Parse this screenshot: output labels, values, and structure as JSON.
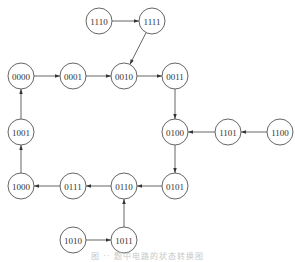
{
  "diagram": {
    "type": "state-transition-diagram",
    "node_radius": 13,
    "nodes": [
      {
        "id": "1110",
        "label": "1110",
        "x": 99,
        "y": 21
      },
      {
        "id": "1111",
        "label": "1111",
        "x": 152,
        "y": 21
      },
      {
        "id": "0000",
        "label": "0000",
        "x": 21,
        "y": 76
      },
      {
        "id": "0001",
        "label": "0001",
        "x": 73,
        "y": 76
      },
      {
        "id": "0010",
        "label": "0010",
        "x": 124,
        "y": 76
      },
      {
        "id": "0011",
        "label": "0011",
        "x": 175,
        "y": 76
      },
      {
        "id": "1001",
        "label": "1001",
        "x": 21,
        "y": 132
      },
      {
        "id": "0100",
        "label": "0100",
        "x": 175,
        "y": 132
      },
      {
        "id": "1101",
        "label": "1101",
        "x": 228,
        "y": 132
      },
      {
        "id": "1100",
        "label": "1100",
        "x": 280,
        "y": 132
      },
      {
        "id": "1000",
        "label": "1000",
        "x": 21,
        "y": 186
      },
      {
        "id": "0111",
        "label": "0111",
        "x": 73,
        "y": 186
      },
      {
        "id": "0110",
        "label": "0110",
        "x": 124,
        "y": 186
      },
      {
        "id": "0101",
        "label": "0101",
        "x": 175,
        "y": 186
      },
      {
        "id": "1010",
        "label": "1010",
        "x": 73,
        "y": 240
      },
      {
        "id": "1011",
        "label": "1011",
        "x": 124,
        "y": 240
      }
    ],
    "edges": [
      {
        "from": "1110",
        "to": "1111"
      },
      {
        "from": "1111",
        "to": "0010"
      },
      {
        "from": "0000",
        "to": "0001"
      },
      {
        "from": "0001",
        "to": "0010"
      },
      {
        "from": "0010",
        "to": "0011"
      },
      {
        "from": "0011",
        "to": "0100"
      },
      {
        "from": "1100",
        "to": "1101"
      },
      {
        "from": "1101",
        "to": "0100"
      },
      {
        "from": "0100",
        "to": "0101"
      },
      {
        "from": "0101",
        "to": "0110"
      },
      {
        "from": "0110",
        "to": "0111"
      },
      {
        "from": "0111",
        "to": "1000"
      },
      {
        "from": "1000",
        "to": "1001"
      },
      {
        "from": "1001",
        "to": "0000"
      },
      {
        "from": "1010",
        "to": "1011"
      },
      {
        "from": "1011",
        "to": "0110"
      }
    ],
    "caption": "图 ·· 题中电路的状态转换图"
  }
}
